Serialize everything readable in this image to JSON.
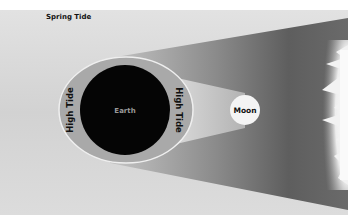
{
  "title": "Spring Tide",
  "labels": {
    "earth": "Earth",
    "moon": "Moon",
    "tide_left": "High Tide",
    "tide_right": "High Tide"
  },
  "colors": {
    "background": "#d6d6d6",
    "earth": "#050505",
    "tidal_bulge": "#a9a9a9",
    "moon": "#f4f4f4",
    "sunlight_band": "#5e5e5e",
    "sun": "#f5f5f5"
  }
}
